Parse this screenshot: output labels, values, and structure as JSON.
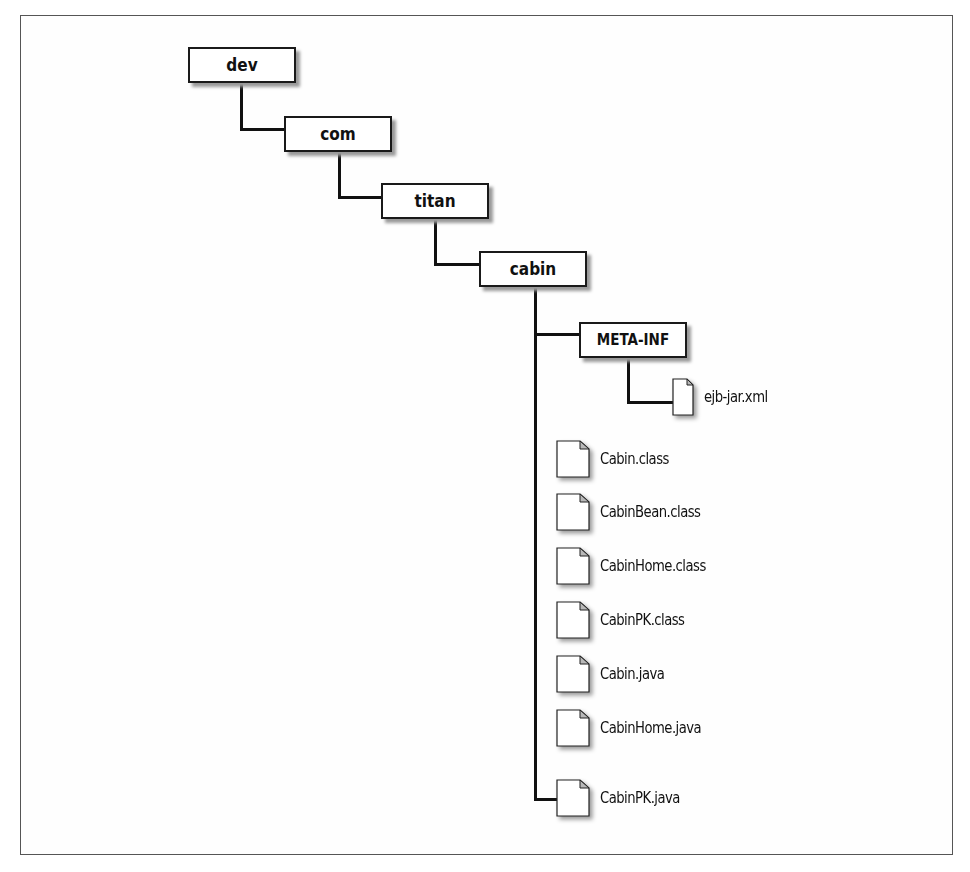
{
  "diagram": {
    "type": "directory-tree",
    "directories": [
      {
        "id": "dev",
        "label": "dev",
        "depth": 0
      },
      {
        "id": "com",
        "label": "com",
        "depth": 1
      },
      {
        "id": "titan",
        "label": "titan",
        "depth": 2
      },
      {
        "id": "cabin",
        "label": "cabin",
        "depth": 3
      },
      {
        "id": "meta_inf",
        "label": "META-INF",
        "depth": 4
      }
    ],
    "meta_inf_files": [
      {
        "label": "ejb-jar.xml"
      }
    ],
    "cabin_files": [
      {
        "label": "Cabin.class"
      },
      {
        "label": "CabinBean.class"
      },
      {
        "label": "CabinHome.class"
      },
      {
        "label": "CabinPK.class"
      },
      {
        "label": "Cabin.java"
      },
      {
        "label": "CabinHome.java"
      },
      {
        "label": "CabinPK.java"
      }
    ],
    "edges": [
      [
        "dev",
        "com"
      ],
      [
        "com",
        "titan"
      ],
      [
        "titan",
        "cabin"
      ],
      [
        "cabin",
        "META-INF"
      ],
      [
        "META-INF",
        "ejb-jar.xml"
      ],
      [
        "cabin",
        "Cabin.class"
      ],
      [
        "cabin",
        "CabinBean.class"
      ],
      [
        "cabin",
        "CabinHome.class"
      ],
      [
        "cabin",
        "CabinPK.class"
      ],
      [
        "cabin",
        "Cabin.java"
      ],
      [
        "cabin",
        "CabinHome.java"
      ],
      [
        "cabin",
        "CabinPK.java"
      ]
    ]
  }
}
